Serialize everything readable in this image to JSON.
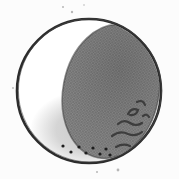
{
  "figure": {
    "type": "illustration",
    "background_color": "#fcfcfc",
    "outline_color": "#2c2c2c",
    "sketch_outline_color": "#4a4a4a",
    "lit_color": "#ffffff",
    "crescent_wash_color": "#c7c7c7",
    "shadow_base_color": "#8d8d8d",
    "shadow_dot_color_1": "#5c5c5c",
    "shadow_dot_color_2": "#6e6e6e",
    "terminator_color": "#3a3a3a",
    "crater_mark_color": "#333333",
    "crescent_dot_color": "#1d1d1d",
    "speck_color": "#9a9a9a",
    "crescent_dots": [
      [
        63,
        146
      ],
      [
        71,
        152
      ],
      [
        79,
        147
      ],
      [
        86,
        153
      ],
      [
        93,
        148
      ],
      [
        100,
        154
      ],
      [
        106,
        149
      ],
      [
        110,
        155
      ]
    ],
    "crater_marks": [
      "M128,114 q4,-7 10,-4 q-2,6 -8,5",
      "M137,102 q6,-3 8,3",
      "M143,116 q4,-3 6,1",
      "M118,124 q6,-5 12,-1 q6,4 12,0",
      "M112,136 q8,-6 16,-2 q8,3 14,-2",
      "M116,147 q7,-4 14,-1"
    ],
    "paper_specks": [
      [
        63,
        7,
        1.0
      ],
      [
        72,
        12,
        1.2
      ],
      [
        84,
        5,
        0.8
      ],
      [
        118,
        170,
        1.4
      ],
      [
        97,
        172,
        1.0
      ],
      [
        13,
        88,
        0.9
      ]
    ]
  }
}
